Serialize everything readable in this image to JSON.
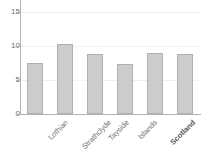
{
  "chart_data": {
    "type": "bar",
    "title": "",
    "xlabel": "",
    "ylabel": "",
    "categories": [
      "Lothian",
      "Strathclyde",
      "Tayside",
      "Islands",
      "Scotland",
      "United Kingdom"
    ],
    "values": [
      7.5,
      10.3,
      8.8,
      7.3,
      9.0,
      8.9
    ],
    "emphasis": [
      false,
      false,
      false,
      false,
      true,
      true
    ],
    "ylim": [
      0,
      16.5
    ],
    "yticks": [
      0,
      5,
      10,
      15
    ],
    "ytick_labels": [
      "0",
      "5",
      "10",
      "15"
    ],
    "grid": true,
    "grid_axis": "y",
    "legend": false,
    "bar_color": "#cccccc",
    "bar_edge_color": "#b0b0b0",
    "axis_color": "#b3b3b3",
    "grid_color": "#f0f0f0",
    "tick_label_color": "#6e6e6e",
    "category_label_color": "#707070",
    "background": "#ffffff"
  }
}
